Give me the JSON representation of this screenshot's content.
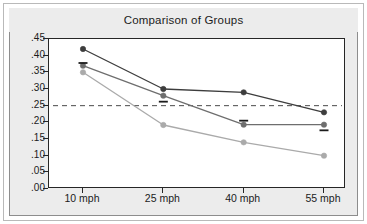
{
  "figure": {
    "title": "Comparison of Groups"
  },
  "chart_data": {
    "type": "line",
    "title": "Comparison of Groups",
    "xlabel": "",
    "ylabel": "",
    "categories": [
      "10 mph",
      "25 mph",
      "40 mph",
      "55 mph"
    ],
    "ylim": [
      0.0,
      0.45
    ],
    "ytick_labels": [
      ".45",
      ".40",
      ".35",
      ".30",
      ".25",
      ".20",
      ".15",
      ".10",
      ".05",
      ".00"
    ],
    "ytick_values": [
      0.45,
      0.4,
      0.35,
      0.3,
      0.25,
      0.2,
      0.15,
      0.1,
      0.05,
      0.0
    ],
    "grid": false,
    "legend": "none",
    "series": [
      {
        "name": "Group 1",
        "color": "#3d3d3d",
        "values": [
          0.42,
          0.3,
          0.29,
          0.23
        ]
      },
      {
        "name": "Group 2",
        "color": "#6e6e6e",
        "values": [
          0.37,
          0.28,
          0.193,
          0.193
        ]
      },
      {
        "name": "Group 3",
        "color": "#aaaaaa",
        "values": [
          0.35,
          0.192,
          0.14,
          0.1
        ]
      }
    ],
    "reference_line": {
      "name": "threshold",
      "value": 0.25,
      "style": "dashed",
      "color": "#4a4a4a"
    },
    "markers": [
      {
        "category": "10 mph",
        "value": 0.378,
        "placement": "above"
      },
      {
        "category": "25 mph",
        "value": 0.262,
        "placement": "below"
      },
      {
        "category": "40 mph",
        "value": 0.205,
        "placement": "above"
      },
      {
        "category": "55 mph",
        "value": 0.176,
        "placement": "below"
      }
    ]
  }
}
